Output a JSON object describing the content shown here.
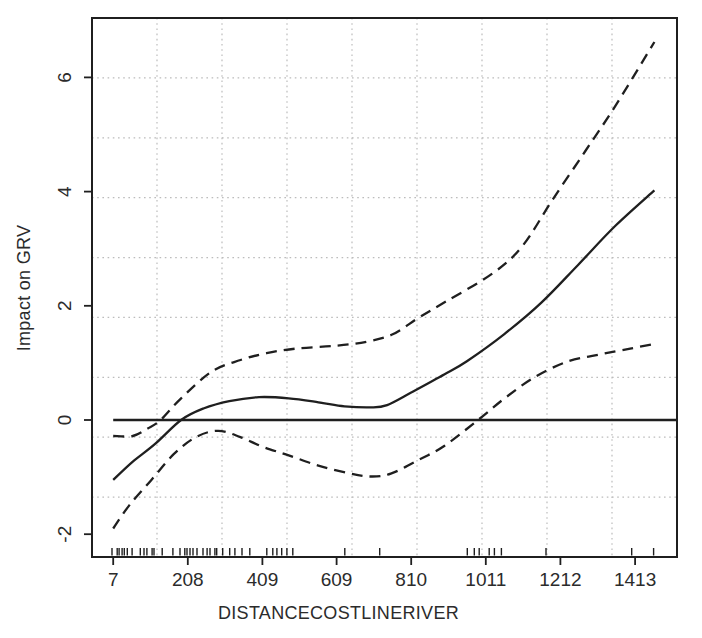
{
  "figure": {
    "background": "#ffffff",
    "line_color": "#1f1f1f",
    "grid_color": "#bcbcbc",
    "text_color": "#2b2b2b"
  },
  "chart_data": {
    "type": "line",
    "title": "",
    "xlabel": "DISTANCECOSTLINERIVER",
    "ylabel": "Impact on GRV",
    "xlim": [
      -50,
      1526
    ],
    "ylim": [
      -2.4,
      7.04
    ],
    "x_tick_values": [
      7,
      208,
      409,
      609,
      810,
      1011,
      1212,
      1413
    ],
    "x_tick_labels": [
      "7",
      "208",
      "409",
      "609",
      "810",
      "1011",
      "1212",
      "1413"
    ],
    "y_tick_values": [
      -2,
      0,
      2,
      4,
      6
    ],
    "y_tick_labels": [
      "-2",
      "0",
      "2",
      "4",
      "6"
    ],
    "grid": {
      "style": "dotted",
      "nx": 9,
      "ny": 9,
      "aligned_to_ticks": false
    },
    "legend": null,
    "series": [
      {
        "name": "estimate",
        "style": "solid",
        "points": [
          [
            7,
            -1.05
          ],
          [
            60,
            -0.73
          ],
          [
            120,
            -0.42
          ],
          [
            190,
            0.0
          ],
          [
            250,
            0.2
          ],
          [
            320,
            0.33
          ],
          [
            400,
            0.4
          ],
          [
            480,
            0.38
          ],
          [
            560,
            0.31
          ],
          [
            630,
            0.24
          ],
          [
            700,
            0.22
          ],
          [
            745,
            0.26
          ],
          [
            810,
            0.48
          ],
          [
            900,
            0.8
          ],
          [
            960,
            1.03
          ],
          [
            1060,
            1.5
          ],
          [
            1160,
            2.05
          ],
          [
            1260,
            2.72
          ],
          [
            1360,
            3.4
          ],
          [
            1465,
            4.02
          ]
        ]
      },
      {
        "name": "upper_ci",
        "style": "dashed",
        "points": [
          [
            7,
            -0.28
          ],
          [
            60,
            -0.28
          ],
          [
            100,
            -0.15
          ],
          [
            135,
            0.0
          ],
          [
            190,
            0.38
          ],
          [
            273,
            0.85
          ],
          [
            350,
            1.05
          ],
          [
            420,
            1.17
          ],
          [
            500,
            1.25
          ],
          [
            609,
            1.3
          ],
          [
            690,
            1.37
          ],
          [
            760,
            1.5
          ],
          [
            832,
            1.8
          ],
          [
            905,
            2.08
          ],
          [
            1030,
            2.57
          ],
          [
            1110,
            3.05
          ],
          [
            1190,
            3.85
          ],
          [
            1280,
            4.72
          ],
          [
            1360,
            5.5
          ],
          [
            1465,
            6.62
          ]
        ]
      },
      {
        "name": "lower_ci",
        "style": "dashed",
        "points": [
          [
            7,
            -1.9
          ],
          [
            50,
            -1.5
          ],
          [
            110,
            -1.05
          ],
          [
            170,
            -0.6
          ],
          [
            230,
            -0.3
          ],
          [
            290,
            -0.19
          ],
          [
            350,
            -0.3
          ],
          [
            410,
            -0.47
          ],
          [
            480,
            -0.62
          ],
          [
            560,
            -0.8
          ],
          [
            640,
            -0.93
          ],
          [
            700,
            -0.99
          ],
          [
            755,
            -0.94
          ],
          [
            830,
            -0.7
          ],
          [
            900,
            -0.45
          ],
          [
            990,
            0.0
          ],
          [
            1060,
            0.37
          ],
          [
            1140,
            0.74
          ],
          [
            1230,
            1.02
          ],
          [
            1320,
            1.15
          ],
          [
            1400,
            1.25
          ],
          [
            1465,
            1.33
          ]
        ]
      },
      {
        "name": "zero_reference",
        "style": "solid",
        "straight": true,
        "points": [
          [
            7,
            0
          ],
          [
            1526,
            0
          ]
        ]
      }
    ],
    "rug_x": [
      4,
      18,
      23,
      31,
      37,
      45,
      58,
      80,
      90,
      98,
      112,
      117,
      139,
      168,
      187,
      200,
      206,
      214,
      222,
      233,
      249,
      260,
      268,
      281,
      286,
      302,
      321,
      335,
      354,
      375,
      421,
      437,
      448,
      461,
      475,
      491,
      631,
      725,
      961,
      980,
      993,
      1020,
      1034,
      1053,
      1173,
      1404,
      1463
    ]
  }
}
